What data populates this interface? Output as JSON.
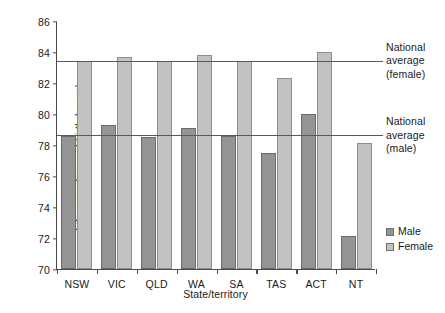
{
  "chart_data": {
    "type": "bar",
    "title": "",
    "xlabel": "State/territory",
    "ylabel": "Life expectancy at birth (years)",
    "ylim": [
      70,
      86
    ],
    "yticks": [
      70,
      72,
      74,
      76,
      78,
      80,
      82,
      84,
      86
    ],
    "grid": false,
    "legend_position": "right",
    "categories": [
      "NSW",
      "VIC",
      "QLD",
      "WA",
      "SA",
      "TAS",
      "ACT",
      "NT"
    ],
    "series": [
      {
        "name": "Male",
        "color": "#949494",
        "values": [
          78.6,
          79.3,
          78.5,
          79.1,
          78.6,
          77.5,
          80.0,
          72.1
        ]
      },
      {
        "name": "Female",
        "color": "#c2c2c2",
        "values": [
          83.4,
          83.7,
          83.4,
          83.8,
          83.4,
          82.3,
          84.0,
          78.1
        ]
      }
    ],
    "reference_lines": [
      {
        "id": "female-average",
        "value": 83.5,
        "label": "National average (female)",
        "label_lines": [
          "National",
          "average",
          "(female)"
        ]
      },
      {
        "id": "male-average",
        "value": 78.7,
        "label": "National average (male)",
        "label_lines": [
          "National",
          "average",
          "(male)"
        ]
      }
    ]
  }
}
